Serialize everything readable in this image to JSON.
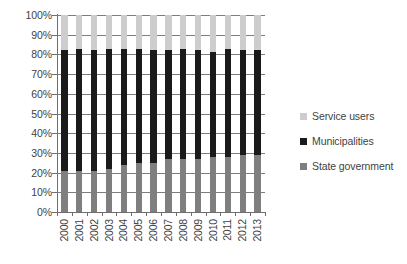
{
  "chart_data": {
    "type": "bar",
    "subtype": "100-percent-stacked-column",
    "title": "",
    "subtitle": "",
    "xlabel": "",
    "ylabel": "",
    "ylim": [
      0,
      100
    ],
    "yticks": [
      "0%",
      "10%",
      "20%",
      "30%",
      "40%",
      "50%",
      "60%",
      "70%",
      "80%",
      "90%",
      "100%"
    ],
    "ytick_values": [
      0,
      10,
      20,
      30,
      40,
      50,
      60,
      70,
      80,
      90,
      100
    ],
    "grid": true,
    "legend_position": "right",
    "categories": [
      "2000",
      "2001",
      "2002",
      "2003",
      "2004",
      "2005",
      "2006",
      "2007",
      "2008",
      "2009",
      "2010",
      "2011",
      "2012",
      "2013"
    ],
    "series": [
      {
        "name": "State government",
        "color": "#7f7f7f",
        "values": [
          21,
          21,
          21,
          22,
          24,
          25,
          25,
          27,
          27,
          27,
          28,
          28,
          29,
          29
        ]
      },
      {
        "name": "Municipalities",
        "color": "#1a1a1a",
        "values": [
          61,
          62,
          61,
          61,
          59,
          58,
          57,
          55,
          56,
          55,
          53,
          55,
          53,
          53
        ]
      },
      {
        "name": "Service users",
        "color": "#cdcdcd",
        "values": [
          18,
          17,
          18,
          17,
          17,
          17,
          18,
          18,
          17,
          18,
          19,
          17,
          18,
          18
        ]
      }
    ],
    "cumulative_tops": {
      "state_government": [
        21,
        21,
        21,
        22,
        24,
        25,
        25,
        27,
        27,
        27,
        28,
        28,
        29,
        29
      ],
      "municipalities": [
        82,
        83,
        82,
        83,
        83,
        83,
        82,
        82,
        83,
        82,
        81,
        83,
        82,
        82
      ],
      "service_users": [
        100,
        100,
        100,
        100,
        100,
        100,
        100,
        100,
        100,
        100,
        100,
        100,
        100,
        100
      ]
    }
  },
  "legend": {
    "items": [
      {
        "label": "Service users",
        "color": "#cdcdcd"
      },
      {
        "label": "Municipalities",
        "color": "#1a1a1a"
      },
      {
        "label": "State government",
        "color": "#7f7f7f"
      }
    ]
  }
}
